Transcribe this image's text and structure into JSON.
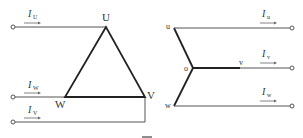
{
  "diagram": {
    "type": "three-phase delta and star (wye) connection",
    "delta": {
      "nodes": [
        {
          "id": "U",
          "label": "U"
        },
        {
          "id": "W",
          "label": "W"
        },
        {
          "id": "V",
          "label": "V"
        }
      ],
      "currents": [
        {
          "symbol": "I",
          "sub": "U"
        },
        {
          "symbol": "I",
          "sub": "W"
        },
        {
          "symbol": "I",
          "sub": "V"
        }
      ]
    },
    "star": {
      "nodes": [
        {
          "id": "u",
          "label": "u"
        },
        {
          "id": "o",
          "label": "o"
        },
        {
          "id": "v",
          "label": "v"
        },
        {
          "id": "w",
          "label": "w"
        }
      ],
      "currents": [
        {
          "symbol": "I",
          "sub": "u"
        },
        {
          "symbol": "I",
          "sub": "v"
        },
        {
          "symbol": "I",
          "sub": "w"
        }
      ]
    },
    "colors": {
      "line": "#555555",
      "winding": "#222222",
      "text": "#333333"
    }
  }
}
